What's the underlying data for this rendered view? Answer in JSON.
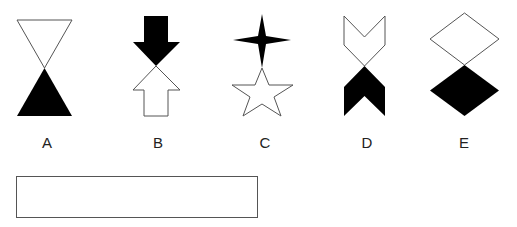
{
  "options": [
    {
      "label": "A",
      "x": 47,
      "figure": "hourglass-triangles",
      "top_fill": "white",
      "bottom_fill": "black"
    },
    {
      "label": "B",
      "x": 158,
      "figure": "opposing-arrows",
      "top_fill": "black",
      "bottom_fill": "white"
    },
    {
      "label": "C",
      "x": 265,
      "figure": "four-point-star-over-five-point-star",
      "top_fill": "black",
      "bottom_fill": "white"
    },
    {
      "label": "D",
      "x": 367,
      "figure": "opposing-chevrons",
      "top_fill": "white",
      "bottom_fill": "black"
    },
    {
      "label": "E",
      "x": 464,
      "figure": "stacked-diamonds",
      "top_fill": "white",
      "bottom_fill": "black"
    }
  ],
  "answer_box": {
    "value": ""
  },
  "colors": {
    "fill": "#000000",
    "stroke": "#555555",
    "background": "#ffffff"
  }
}
